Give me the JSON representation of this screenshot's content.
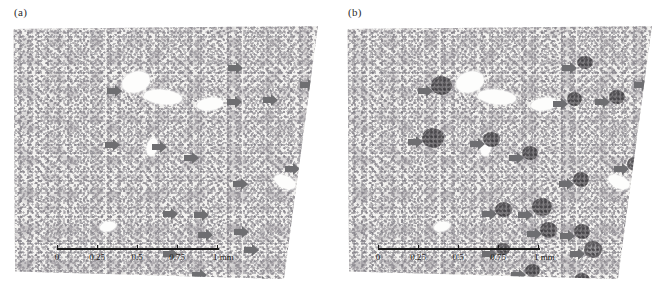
{
  "figure": {
    "panels": [
      {
        "id": "a",
        "label": "(a)",
        "caption_label": "(a)",
        "scalebar": {
          "ticks": [
            "0",
            "0.25",
            "0.5",
            "0.75",
            "1"
          ],
          "unit": "mm",
          "end_label": "1 mm",
          "total_length_mm": 1
        },
        "arrows": [
          {
            "x": 216,
            "y": 36
          },
          {
            "x": 95,
            "y": 59
          },
          {
            "x": 288,
            "y": 53
          },
          {
            "x": 215,
            "y": 70
          },
          {
            "x": 251,
            "y": 68
          },
          {
            "x": 93,
            "y": 113
          },
          {
            "x": 140,
            "y": 115
          },
          {
            "x": 172,
            "y": 126
          },
          {
            "x": 273,
            "y": 137
          },
          {
            "x": 221,
            "y": 152
          },
          {
            "x": 151,
            "y": 182
          },
          {
            "x": 182,
            "y": 183
          },
          {
            "x": 186,
            "y": 203
          },
          {
            "x": 222,
            "y": 200
          },
          {
            "x": 232,
            "y": 218
          },
          {
            "x": 151,
            "y": 222
          },
          {
            "x": 180,
            "y": 243
          },
          {
            "x": 242,
            "y": 250
          }
        ],
        "lesions": []
      },
      {
        "id": "b",
        "label": "(b)",
        "caption_label": "(b)",
        "scalebar": {
          "ticks": [
            "0",
            "0.25",
            "0.5",
            "0.75",
            "1"
          ],
          "unit": "mm",
          "end_label": "1 mm",
          "total_length_mm": 1
        },
        "arrows": [
          {
            "x": 216,
            "y": 36
          },
          {
            "x": 72,
            "y": 59
          },
          {
            "x": 288,
            "y": 53
          },
          {
            "x": 207,
            "y": 72
          },
          {
            "x": 249,
            "y": 70
          },
          {
            "x": 62,
            "y": 110
          },
          {
            "x": 124,
            "y": 112
          },
          {
            "x": 163,
            "y": 126
          },
          {
            "x": 268,
            "y": 137
          },
          {
            "x": 213,
            "y": 152
          },
          {
            "x": 136,
            "y": 182
          },
          {
            "x": 172,
            "y": 183
          },
          {
            "x": 181,
            "y": 202
          },
          {
            "x": 214,
            "y": 204
          },
          {
            "x": 136,
            "y": 222
          },
          {
            "x": 224,
            "y": 222
          },
          {
            "x": 165,
            "y": 243
          },
          {
            "x": 243,
            "y": 253
          }
        ],
        "lesions": [
          {
            "x": 231,
            "y": 30,
            "w": 16,
            "h": 13,
            "style": "solid"
          },
          {
            "x": 85,
            "y": 50,
            "w": 21,
            "h": 19,
            "style": "solid"
          },
          {
            "x": 302,
            "y": 47,
            "w": 14,
            "h": 13,
            "style": "ring"
          },
          {
            "x": 221,
            "y": 66,
            "w": 15,
            "h": 14,
            "style": "solid"
          },
          {
            "x": 263,
            "y": 64,
            "w": 16,
            "h": 14,
            "style": "solid"
          },
          {
            "x": 76,
            "y": 102,
            "w": 22,
            "h": 20,
            "style": "solid"
          },
          {
            "x": 137,
            "y": 106,
            "w": 17,
            "h": 15,
            "style": "solid"
          },
          {
            "x": 176,
            "y": 120,
            "w": 16,
            "h": 14,
            "style": "solid"
          },
          {
            "x": 281,
            "y": 131,
            "w": 15,
            "h": 14,
            "style": "ring"
          },
          {
            "x": 227,
            "y": 146,
            "w": 16,
            "h": 15,
            "style": "solid"
          },
          {
            "x": 149,
            "y": 176,
            "w": 17,
            "h": 15,
            "style": "solid"
          },
          {
            "x": 186,
            "y": 172,
            "w": 20,
            "h": 18,
            "style": "solid"
          },
          {
            "x": 194,
            "y": 196,
            "w": 17,
            "h": 16,
            "style": "solid"
          },
          {
            "x": 228,
            "y": 198,
            "w": 16,
            "h": 15,
            "style": "solid"
          },
          {
            "x": 150,
            "y": 217,
            "w": 14,
            "h": 12,
            "style": "ring"
          },
          {
            "x": 238,
            "y": 215,
            "w": 18,
            "h": 17,
            "style": "ring"
          },
          {
            "x": 179,
            "y": 238,
            "w": 15,
            "h": 13,
            "style": "solid"
          },
          {
            "x": 228,
            "y": 247,
            "w": 16,
            "h": 14,
            "style": "solid"
          }
        ]
      }
    ],
    "colors": {
      "arrow": "#6e6e71",
      "lesion": "#6f6d70",
      "tissue_background": "#f3f2f0",
      "scalebar": "#1a1a1a",
      "lumen": "#fdfdfc"
    }
  }
}
